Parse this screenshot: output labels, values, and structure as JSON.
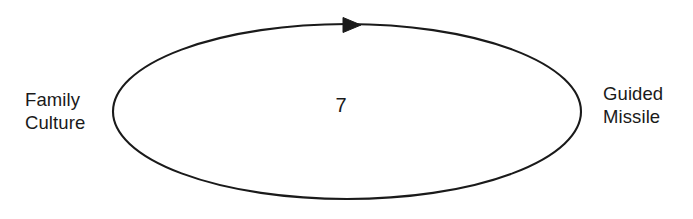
{
  "diagram": {
    "type": "causal-loop-diagram",
    "background_color": "#ffffff",
    "stroke_color": "#1a1a1a",
    "nodes": [
      {
        "id": "family-culture",
        "lines": [
          "Family",
          "Culture"
        ],
        "position": "left"
      },
      {
        "id": "guided-missile",
        "lines": [
          "Guided",
          "Missile"
        ],
        "position": "right"
      }
    ],
    "link": {
      "id": "loop-7",
      "shape": "ellipse",
      "value": "7",
      "direction": "clockwise",
      "arrow": "solid-triangle-right",
      "arrow_position": "top-center"
    }
  }
}
